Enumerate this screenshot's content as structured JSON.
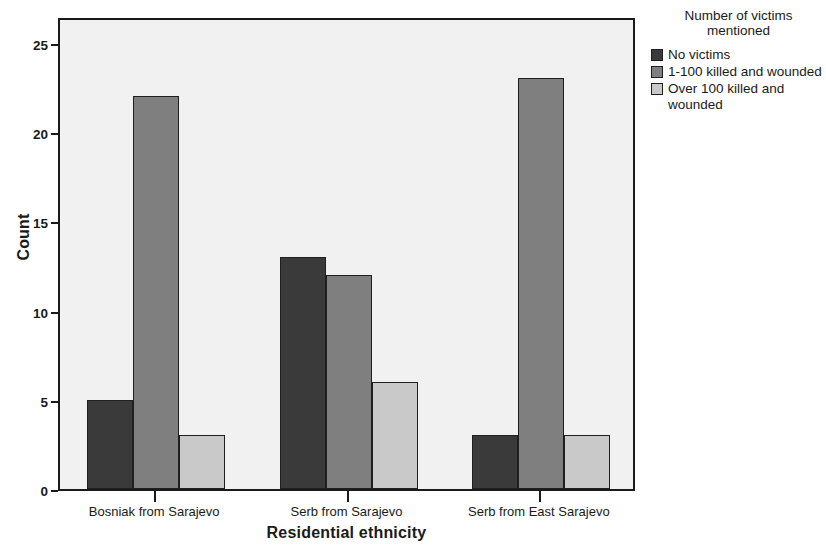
{
  "chart_data": {
    "type": "bar",
    "title": "",
    "xlabel": "Residential ethnicity",
    "ylabel": "Count",
    "categories": [
      "Bosniak from Sarajevo",
      "Serb from Sarajevo",
      "Serb from East Sarajevo"
    ],
    "series": [
      {
        "name": "No victims",
        "values": [
          5,
          13,
          3
        ],
        "color": "#3a3a3a"
      },
      {
        "name": "1-100 killed and wounded",
        "values": [
          22,
          12,
          23
        ],
        "color": "#7f7f7f"
      },
      {
        "name": "Over 100 killed and wounded",
        "values": [
          3,
          6,
          3
        ],
        "color": "#c9c9c9"
      }
    ],
    "ylim": [
      0,
      26.5
    ],
    "yticks": [
      0,
      5,
      10,
      15,
      20,
      25
    ],
    "ytick_labels": [
      "0",
      "5",
      "10",
      "15",
      "20",
      "25"
    ],
    "grid": false,
    "legend_position": "right",
    "legend_title": "Number of victims\nmentioned",
    "plot_background": "#f1f1f1",
    "axis_color": "#1a1a1a"
  },
  "axes": {
    "y_title": "Count",
    "x_title": "Residential ethnicity"
  },
  "legend": {
    "title": "Number of victims\nmentioned",
    "items": [
      {
        "label": "No victims",
        "color": "#3a3a3a"
      },
      {
        "label": "1-100 killed and wounded",
        "color": "#7f7f7f"
      },
      {
        "label": "Over 100 killed and wounded",
        "color": "#c9c9c9"
      }
    ]
  }
}
